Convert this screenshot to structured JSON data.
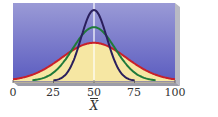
{
  "chart_data": {
    "type": "line",
    "title": "",
    "xlabel": "X̄",
    "ylabel": "",
    "xlim": [
      0,
      100
    ],
    "x_ticks": [
      0,
      25,
      50,
      75,
      100
    ],
    "x_tick_labels": [
      "0",
      "25",
      "50",
      "75",
      "100"
    ],
    "grid": false,
    "legend": null,
    "center_line": 50,
    "series": [
      {
        "name": "wide distribution",
        "color": "#c8202a",
        "mean": 50,
        "sd": 20,
        "x_range": [
          0,
          100
        ],
        "relative_peak": 0.49
      },
      {
        "name": "medium distribution",
        "color": "#1f7a3a",
        "mean": 50,
        "sd": 13,
        "x_range": [
          12,
          88
        ],
        "relative_peak": 0.69
      },
      {
        "name": "narrow distribution",
        "color": "#2a1f5c",
        "mean": 50,
        "sd": 8,
        "x_range": [
          25,
          75
        ],
        "relative_peak": 0.91
      }
    ]
  },
  "colors": {
    "background_top": "#9a9ad6",
    "background_bottom": "#5b5cc0",
    "fill": "#f6e7a3",
    "center_line": "#ffffff",
    "frame_edge": "#b9bac4"
  },
  "axis": {
    "tick_labels": [
      "0",
      "25",
      "50",
      "75",
      "100"
    ],
    "label": "X"
  }
}
